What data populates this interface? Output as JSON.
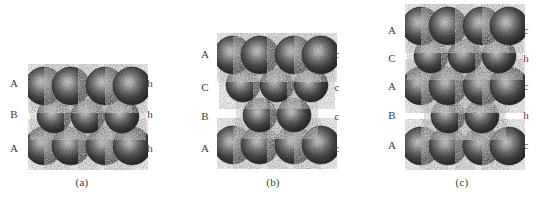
{
  "figure": {
    "background_color": "#ffffff",
    "sphere_color_dark": "#262626",
    "sphere_color_mid": "#4a4a4a",
    "sphere_color_light": "#d8d8d8",
    "label_color": "#3a3a3a",
    "width": 545,
    "height": 201
  },
  "panels": [
    {
      "id": "a",
      "caption": "(a)",
      "caption_x": 82,
      "caption_y": 176,
      "origin_x": 28,
      "origin_y": 64,
      "svg_width": 120,
      "svg_height": 106,
      "label_left_x": 14,
      "label_right_x": 150,
      "layers": [
        {
          "left": "A",
          "right": "h",
          "label_y": 83,
          "row": "wide",
          "cy": 22,
          "count": 4
        },
        {
          "left": "B",
          "right": "h",
          "label_y": 114,
          "row": "narrow",
          "cy": 52,
          "count": 3
        },
        {
          "left": "A",
          "right": "h",
          "label_y": 148,
          "row": "wide",
          "cy": 82,
          "count": 4
        }
      ]
    },
    {
      "id": "b",
      "caption": "(b)",
      "caption_x": 273,
      "caption_y": 176,
      "origin_x": 217,
      "origin_y": 33,
      "svg_width": 120,
      "svg_height": 136,
      "label_left_x": 205,
      "label_right_x": 337,
      "layers": [
        {
          "left": "A",
          "right": "c",
          "label_y": 54,
          "row": "wide",
          "cy": 22,
          "count": 4
        },
        {
          "left": "C",
          "right": "c",
          "label_y": 87,
          "row": "narrow",
          "cy": 52,
          "count": 3
        },
        {
          "left": "B",
          "right": "c",
          "label_y": 116,
          "row": "inner",
          "cy": 82,
          "count": 2
        },
        {
          "left": "A",
          "right": "c",
          "label_y": 148,
          "row": "wide",
          "cy": 112,
          "count": 4
        }
      ]
    },
    {
      "id": "c",
      "caption": "(c)",
      "caption_x": 462,
      "caption_y": 176,
      "origin_x": 405,
      "origin_y": 4,
      "svg_width": 120,
      "svg_height": 166,
      "label_left_x": 392,
      "label_right_x": 526,
      "layers": [
        {
          "left": "A",
          "right": "c",
          "label_y": 30,
          "row": "wide",
          "cy": 22,
          "count": 4
        },
        {
          "left": "C",
          "right": "h",
          "label_y": 58,
          "row": "narrow",
          "cy": 52,
          "count": 3
        },
        {
          "left": "A",
          "right": "c",
          "label_y": 86,
          "row": "wide",
          "cy": 82,
          "count": 4
        },
        {
          "left": "B",
          "right": "h",
          "label_y": 115,
          "row": "inner",
          "cy": 112,
          "count": 2
        },
        {
          "left": "A",
          "right": "c",
          "label_y": 145,
          "row": "wide",
          "cy": 142,
          "count": 4
        }
      ]
    }
  ],
  "geometry": {
    "sphere_radius_wide": 19,
    "sphere_radius_narrow": 17,
    "wide_centers": [
      16,
      43,
      77,
      104
    ],
    "narrow_centers": [
      26,
      60,
      94
    ],
    "inner_centers": [
      43,
      77
    ]
  }
}
